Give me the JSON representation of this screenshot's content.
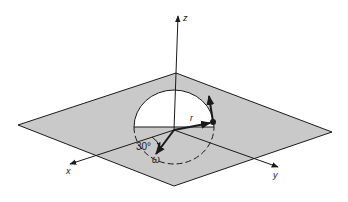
{
  "diagram": {
    "type": "3d-coordinate-diagram",
    "colors": {
      "background": "#ffffff",
      "plane_fill": "#c9c9c9",
      "line": "#1a1a1a",
      "hemisphere_fill": "#ffffff"
    },
    "axes": {
      "z": {
        "label": "z"
      },
      "x": {
        "label": "x"
      },
      "y": {
        "label": "y"
      }
    },
    "vectors": {
      "r": {
        "label": "r"
      },
      "omega": {
        "label": "ω"
      }
    },
    "angle": {
      "label": "30°"
    }
  }
}
